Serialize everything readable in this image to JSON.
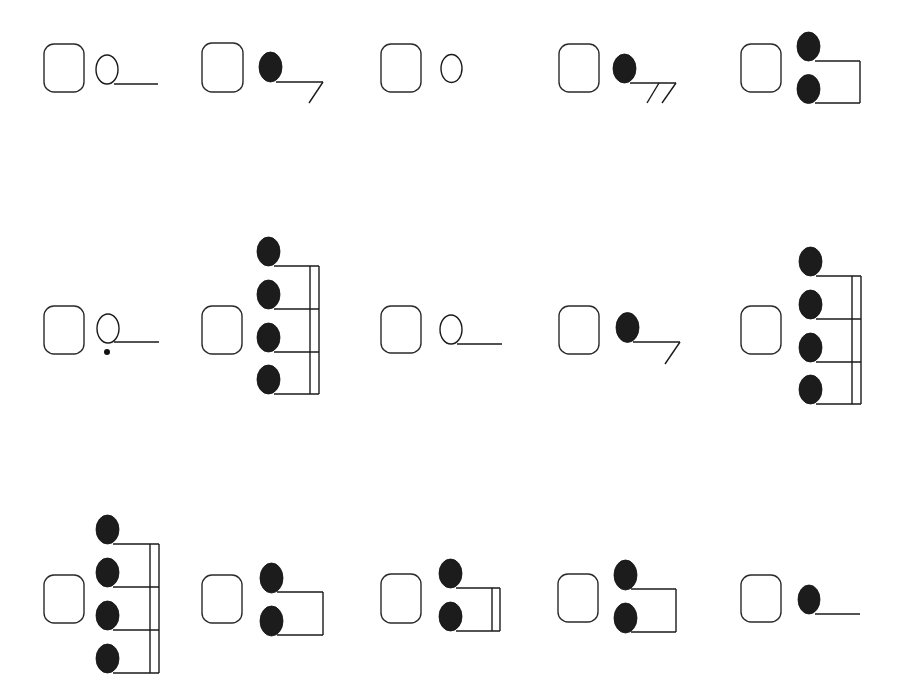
{
  "worksheet": {
    "title": "",
    "instructions": "",
    "colors": {
      "ink": "#1a1a1a",
      "note_fill": "#1c1c1c",
      "background": "#ffffff"
    },
    "items": [
      {
        "index": 1,
        "row": 1,
        "type": "half-note",
        "answer": "",
        "box": {
          "x": 44,
          "y": 44,
          "w": 40,
          "h": 48
        },
        "notes": [
          {
            "cx": 107,
            "cy": 69.5,
            "rx": 11,
            "ry": 14.5,
            "filled": false
          }
        ],
        "lines": [
          [
            114,
            84,
            158,
            84
          ]
        ],
        "dots": []
      },
      {
        "index": 2,
        "row": 1,
        "type": "eighth-note",
        "answer": "",
        "box": {
          "x": 202,
          "y": 43,
          "w": 41,
          "h": 49
        },
        "notes": [
          {
            "cx": 270.5,
            "cy": 67,
            "rx": 11.5,
            "ry": 15,
            "filled": true
          }
        ],
        "lines": [
          [
            276,
            82,
            323,
            82
          ],
          [
            323,
            82,
            309,
            103
          ]
        ],
        "dots": []
      },
      {
        "index": 3,
        "row": 1,
        "type": "whole-note",
        "answer": "",
        "box": {
          "x": 381,
          "y": 44,
          "w": 40,
          "h": 48
        },
        "notes": [
          {
            "cx": 451.5,
            "cy": 68.5,
            "rx": 10.5,
            "ry": 14,
            "filled": false
          }
        ],
        "lines": [],
        "dots": []
      },
      {
        "index": 4,
        "row": 1,
        "type": "sixteenth-note",
        "answer": "",
        "box": {
          "x": 559,
          "y": 44,
          "w": 40,
          "h": 48
        },
        "notes": [
          {
            "cx": 624.5,
            "cy": 68.5,
            "rx": 11.5,
            "ry": 14.5,
            "filled": true
          }
        ],
        "lines": [
          [
            630,
            83,
            676,
            83
          ],
          [
            659,
            83,
            647,
            103
          ],
          [
            676,
            83,
            662,
            103
          ]
        ],
        "dots": []
      },
      {
        "index": 5,
        "row": 1,
        "type": "two-eighth-notes",
        "answer": "",
        "box": {
          "x": 741,
          "y": 44,
          "w": 40,
          "h": 48
        },
        "notes": [
          {
            "cx": 808.5,
            "cy": 46.5,
            "rx": 11.5,
            "ry": 14.5,
            "filled": true
          },
          {
            "cx": 808.5,
            "cy": 89,
            "rx": 11.5,
            "ry": 14.5,
            "filled": true
          }
        ],
        "lines": [
          [
            815,
            61,
            860,
            61
          ],
          [
            815,
            103,
            860,
            103
          ],
          [
            860,
            61,
            860,
            103
          ]
        ],
        "dots": []
      },
      {
        "index": 6,
        "row": 2,
        "type": "dotted-half-note",
        "answer": "",
        "box": {
          "x": 44,
          "y": 306,
          "w": 40,
          "h": 48
        },
        "notes": [
          {
            "cx": 108,
            "cy": 328.5,
            "rx": 11,
            "ry": 14.5,
            "filled": false
          }
        ],
        "lines": [
          [
            114,
            342,
            159,
            342
          ]
        ],
        "dots": [
          {
            "cx": 107,
            "cy": 352,
            "r": 3
          }
        ]
      },
      {
        "index": 7,
        "row": 2,
        "type": "four-sixteenth-notes",
        "answer": "",
        "box": {
          "x": 202,
          "y": 306,
          "w": 40,
          "h": 48
        },
        "notes": [
          {
            "cx": 268.5,
            "cy": 251.5,
            "rx": 11.5,
            "ry": 14.5,
            "filled": true
          },
          {
            "cx": 268.5,
            "cy": 294.5,
            "rx": 11.5,
            "ry": 14.5,
            "filled": true
          },
          {
            "cx": 268.5,
            "cy": 337.5,
            "rx": 11.5,
            "ry": 14.5,
            "filled": true
          },
          {
            "cx": 268.5,
            "cy": 379.5,
            "rx": 11.5,
            "ry": 14.5,
            "filled": true
          }
        ],
        "lines": [
          [
            274,
            266,
            319,
            266
          ],
          [
            274,
            309,
            319,
            309
          ],
          [
            274,
            352,
            319,
            352
          ],
          [
            274,
            394,
            319,
            394
          ],
          [
            310,
            266,
            310,
            394
          ],
          [
            319,
            266,
            319,
            394
          ]
        ],
        "dots": []
      },
      {
        "index": 8,
        "row": 2,
        "type": "half-note",
        "answer": "",
        "box": {
          "x": 381,
          "y": 306,
          "w": 40,
          "h": 47
        },
        "notes": [
          {
            "cx": 451,
            "cy": 329.5,
            "rx": 11,
            "ry": 14.5,
            "filled": false
          }
        ],
        "lines": [
          [
            457,
            344,
            502,
            344
          ]
        ],
        "dots": []
      },
      {
        "index": 9,
        "row": 2,
        "type": "eighth-note",
        "answer": "",
        "box": {
          "x": 559,
          "y": 306,
          "w": 40,
          "h": 48
        },
        "notes": [
          {
            "cx": 627.5,
            "cy": 327.5,
            "rx": 11.5,
            "ry": 15,
            "filled": true
          }
        ],
        "lines": [
          [
            633,
            342,
            680,
            342
          ],
          [
            680,
            342,
            665,
            364
          ]
        ],
        "dots": []
      },
      {
        "index": 10,
        "row": 2,
        "type": "four-sixteenth-notes",
        "answer": "",
        "box": {
          "x": 741,
          "y": 306,
          "w": 40,
          "h": 48
        },
        "notes": [
          {
            "cx": 810.5,
            "cy": 261.5,
            "rx": 11.5,
            "ry": 14.5,
            "filled": true
          },
          {
            "cx": 810.5,
            "cy": 304.5,
            "rx": 11.5,
            "ry": 14.5,
            "filled": true
          },
          {
            "cx": 810.5,
            "cy": 347.5,
            "rx": 11.5,
            "ry": 14.5,
            "filled": true
          },
          {
            "cx": 810.5,
            "cy": 389.5,
            "rx": 11.5,
            "ry": 14.5,
            "filled": true
          }
        ],
        "lines": [
          [
            816,
            276,
            861,
            276
          ],
          [
            816,
            319,
            861,
            319
          ],
          [
            816,
            362,
            861,
            362
          ],
          [
            816,
            404,
            861,
            404
          ],
          [
            852,
            276,
            852,
            404
          ],
          [
            861,
            276,
            861,
            404
          ]
        ],
        "dots": []
      },
      {
        "index": 11,
        "row": 3,
        "type": "four-sixteenth-notes",
        "answer": "",
        "box": {
          "x": 44,
          "y": 575,
          "w": 40,
          "h": 48
        },
        "notes": [
          {
            "cx": 107.5,
            "cy": 529.5,
            "rx": 11.5,
            "ry": 14.5,
            "filled": true
          },
          {
            "cx": 107.5,
            "cy": 572.5,
            "rx": 11.5,
            "ry": 14.5,
            "filled": true
          },
          {
            "cx": 107.5,
            "cy": 615.5,
            "rx": 11.5,
            "ry": 14.5,
            "filled": true
          },
          {
            "cx": 107.5,
            "cy": 658.5,
            "rx": 11.5,
            "ry": 14.5,
            "filled": true
          }
        ],
        "lines": [
          [
            113,
            544,
            159,
            544
          ],
          [
            113,
            587,
            159,
            587
          ],
          [
            113,
            630,
            159,
            630
          ],
          [
            113,
            673,
            159,
            673
          ],
          [
            150,
            544,
            150,
            673
          ],
          [
            159,
            544,
            159,
            673
          ]
        ],
        "dots": []
      },
      {
        "index": 12,
        "row": 3,
        "type": "two-eighth-notes",
        "answer": "",
        "box": {
          "x": 202,
          "y": 575,
          "w": 40,
          "h": 48
        },
        "notes": [
          {
            "cx": 271.5,
            "cy": 578,
            "rx": 11.5,
            "ry": 15,
            "filled": true
          },
          {
            "cx": 271.5,
            "cy": 621,
            "rx": 11.5,
            "ry": 15,
            "filled": true
          }
        ],
        "lines": [
          [
            277,
            592,
            323,
            592
          ],
          [
            277,
            635,
            323,
            635
          ],
          [
            323,
            592,
            323,
            635
          ]
        ],
        "dots": []
      },
      {
        "index": 13,
        "row": 3,
        "type": "two-sixteenth-notes",
        "answer": "",
        "box": {
          "x": 381,
          "y": 574,
          "w": 40,
          "h": 49
        },
        "notes": [
          {
            "cx": 450.5,
            "cy": 573.5,
            "rx": 11.5,
            "ry": 14.5,
            "filled": true
          },
          {
            "cx": 450.5,
            "cy": 616.5,
            "rx": 11.5,
            "ry": 14.5,
            "filled": true
          }
        ],
        "lines": [
          [
            456,
            588,
            500,
            588
          ],
          [
            456,
            631,
            500,
            631
          ],
          [
            492,
            588,
            492,
            631
          ],
          [
            500,
            588,
            500,
            631
          ]
        ],
        "dots": []
      },
      {
        "index": 14,
        "row": 3,
        "type": "two-eighth-notes",
        "answer": "",
        "box": {
          "x": 558,
          "y": 574,
          "w": 40,
          "h": 48
        },
        "notes": [
          {
            "cx": 625.5,
            "cy": 575,
            "rx": 11.5,
            "ry": 15,
            "filled": true
          },
          {
            "cx": 625.5,
            "cy": 618,
            "rx": 11.5,
            "ry": 15,
            "filled": true
          }
        ],
        "lines": [
          [
            631,
            589,
            676,
            589
          ],
          [
            631,
            632,
            676,
            632
          ],
          [
            676,
            589,
            676,
            632
          ]
        ],
        "dots": []
      },
      {
        "index": 15,
        "row": 3,
        "type": "quarter-note",
        "answer": "",
        "box": {
          "x": 741,
          "y": 575,
          "w": 40,
          "h": 47
        },
        "notes": [
          {
            "cx": 809,
            "cy": 599.5,
            "rx": 11,
            "ry": 14.5,
            "filled": true
          }
        ],
        "lines": [
          [
            815,
            614,
            860,
            614
          ]
        ],
        "dots": []
      }
    ]
  }
}
